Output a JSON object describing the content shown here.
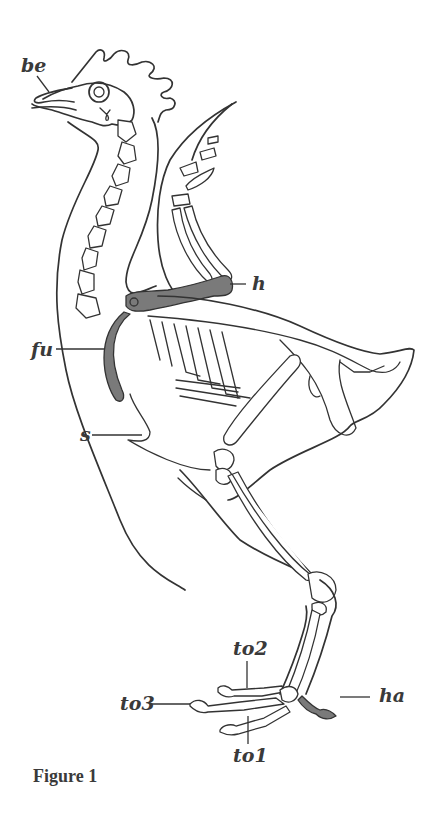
{
  "figure": {
    "caption": "Figure 1",
    "highlight_color": "#7a7a7a",
    "line_color": "#333333",
    "labels": [
      {
        "id": "be",
        "text": "be"
      },
      {
        "id": "h",
        "text": "h"
      },
      {
        "id": "fu",
        "text": "fu"
      },
      {
        "id": "s",
        "text": "s"
      },
      {
        "id": "to2",
        "text": "to2"
      },
      {
        "id": "to3",
        "text": "to3"
      },
      {
        "id": "ha",
        "text": "ha"
      },
      {
        "id": "to1",
        "text": "to1"
      }
    ]
  }
}
